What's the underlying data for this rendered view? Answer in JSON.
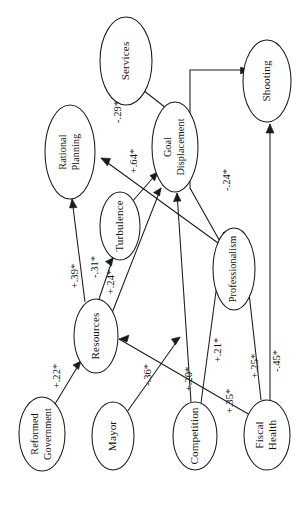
{
  "figure": {
    "type": "path-diagram",
    "orientation_note": "rotated 90 degrees counter-clockwise",
    "background_color": "#ffffff",
    "line_color": "#1a1a1a",
    "text_color": "#111111"
  },
  "nodes": [
    {
      "id": "services",
      "label": "Services",
      "lines": [
        "Services"
      ],
      "cx": 126,
      "cy": 61,
      "rx": 26,
      "ry": 44
    },
    {
      "id": "shooting",
      "label": "Shooting",
      "lines": [
        "Shooting"
      ],
      "cx": 267,
      "cy": 81,
      "rx": 24,
      "ry": 41
    },
    {
      "id": "rational_planning",
      "label": "Rational Planning",
      "lines": [
        "Rational",
        "Planning"
      ],
      "cx": 70,
      "cy": 152,
      "rx": 25,
      "ry": 47
    },
    {
      "id": "goal_displacement",
      "label": "Goal Displacement",
      "lines": [
        "Goal",
        "Displacement"
      ],
      "cx": 175,
      "cy": 147,
      "rx": 23,
      "ry": 45
    },
    {
      "id": "turbulence",
      "label": "Turbulence",
      "lines": [
        "Turbulence"
      ],
      "cx": 120,
      "cy": 226,
      "rx": 20,
      "ry": 34
    },
    {
      "id": "professionalism",
      "label": "Professionalism",
      "lines": [
        "Professionalism"
      ],
      "cx": 234,
      "cy": 269,
      "rx": 21,
      "ry": 41
    },
    {
      "id": "resources",
      "label": "Resources",
      "lines": [
        "Resources"
      ],
      "cx": 96,
      "cy": 336,
      "rx": 22,
      "ry": 37
    },
    {
      "id": "reformed_government",
      "label": "Reformed Government",
      "lines": [
        "Reformed",
        "Government"
      ],
      "cx": 42,
      "cy": 434,
      "rx": 23,
      "ry": 37
    },
    {
      "id": "mayor",
      "label": "Mayor",
      "lines": [
        "Mayor"
      ],
      "cx": 113,
      "cy": 436,
      "rx": 21,
      "ry": 34
    },
    {
      "id": "competition",
      "label": "Competition",
      "lines": [
        "Competition"
      ],
      "cx": 195,
      "cy": 436,
      "rx": 22,
      "ry": 34
    },
    {
      "id": "fiscal_health",
      "label": "Fiscal Health",
      "lines": [
        "Fiscal",
        "Health"
      ],
      "cx": 267,
      "cy": 435,
      "rx": 23,
      "ry": 35
    }
  ],
  "edges": [
    {
      "id": "gd-to-services",
      "from": "goal_displacement",
      "to": "services",
      "coefficient": "-.29*",
      "label_x": 119,
      "label_y": 112,
      "path": "M 166 108 L 134 83",
      "arrow_at": "M 134 83 L 143 84.5 L 140.5 91 Z"
    },
    {
      "id": "turbulence-to-gd",
      "from": "turbulence",
      "to": "goal_displacement",
      "coefficient": "+.64*",
      "label_x": 135,
      "label_y": 161,
      "path": "M 131 203 L 158 172",
      "arrow_at": "M 158 172 L 150 175.5 L 154.5 181 Z"
    },
    {
      "id": "prof-to-rational",
      "from": "professionalism",
      "to": "rational_planning",
      "coefficient": "-.24*",
      "label_x": 228,
      "label_y": 180,
      "path": "M 218 243 L 101 158",
      "arrow_at": "M 101 158 L 110.5 158.5 L 107.5 166 Z"
    },
    {
      "id": "resources-to-rational",
      "from": "resources",
      "to": "rational_planning",
      "coefficient": "+.39*",
      "label_x": 76,
      "label_y": 276,
      "path": "M 85 302 L 72 199",
      "arrow_at": "M 72 199 L 69.5 208 L 77 207.5 Z"
    },
    {
      "id": "resources-to-turbulence",
      "from": "resources",
      "to": "turbulence",
      "coefficient": "-.31*",
      "label_x": 96,
      "label_y": 267,
      "path": "M 99 299 L 113 258",
      "arrow_at": "M 113 258 L 105.5 261.5 L 111.5 266 Z"
    },
    {
      "id": "resources-to-gd",
      "from": "resources",
      "to": "goal_displacement",
      "coefficient": "+.24*",
      "label_x": 112,
      "label_y": 282,
      "path": "M 112 313 L 161 188",
      "arrow_at": "M 161 188 L 153.5 192.5 L 159.5 196 Z"
    },
    {
      "id": "reformed-to-resources",
      "from": "reformed_government",
      "to": "resources",
      "coefficient": "+.22*",
      "label_x": 58,
      "label_y": 376,
      "path": "M 55 404 L 81 361",
      "arrow_at": "M 81 361 L 73 365 L 78.5 369.5 Z"
    },
    {
      "id": "mayor-to-resources",
      "from": "mayor",
      "to": "resources",
      "coefficient": "-.36*",
      "label_x": 149,
      "label_y": 375,
      "path": "M 127 412 L 180 337",
      "arrow_at": "M 180 337 L 171.5 339 L 175.5 345 Z"
    },
    {
      "id": "competition-to-gd",
      "from": "competition",
      "to": "goal_displacement",
      "coefficient": "+.20*",
      "label_x": 190,
      "label_y": 379,
      "path": "M 191 402 L 177 193",
      "arrow_at": "M 177 193 L 173.5 201.5 L 181 201 Z"
    },
    {
      "id": "competition-to-prof",
      "from": "competition",
      "to": "professionalism",
      "coefficient": "+.21*",
      "label_x": 219,
      "label_y": 350,
      "path": "M 201 403 L 224 232",
      "arrow_at": "M 224 232 L 219 239.5 L 226.5 240.5 Z"
    },
    {
      "id": "fiscal-to-resources",
      "from": "fiscal_health",
      "to": "resources",
      "coefficient": "+.35*",
      "label_x": 231,
      "label_y": 401,
      "path": "M 250 415 L 119 339",
      "arrow_at": "M 119 339 L 127 342 L 129 335 Z"
    },
    {
      "id": "fiscal-to-prof",
      "from": "fiscal_health",
      "to": "professionalism",
      "coefficient": "+.25*",
      "label_x": 256,
      "label_y": 366,
      "path": "M 261 400 L 249 293 L 190 188 L 190 70 L 249 70",
      "arrow_at": "M 249 70 L 240.5 67 L 240.5 74 Z"
    },
    {
      "id": "fiscal-to-shooting",
      "from": "fiscal_health",
      "to": "shooting",
      "coefficient": "-.45*",
      "label_x": 278,
      "label_y": 361,
      "path": "M 270 400 L 270 124",
      "arrow_at": "M 270 124 L 266 133 L 274 133 Z"
    }
  ]
}
